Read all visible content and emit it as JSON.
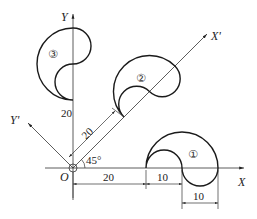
{
  "diagram": {
    "axes": {
      "x_label": "X",
      "y_label": "Y",
      "x_prime_label": "X'",
      "y_prime_label": "Y'",
      "origin_label": "O",
      "angle_label": "45°"
    },
    "shapes": [
      {
        "id": 1,
        "label": "①"
      },
      {
        "id": 2,
        "label": "②"
      },
      {
        "id": 3,
        "label": "③"
      }
    ],
    "dimensions": {
      "shape3_offset": "20",
      "shape2_offset": "20",
      "shape1_offset": "20",
      "shape1_width_left": "10",
      "shape1_width_right": "10"
    },
    "colors": {
      "stroke": "#1a1a1a",
      "background": "#ffffff"
    }
  }
}
